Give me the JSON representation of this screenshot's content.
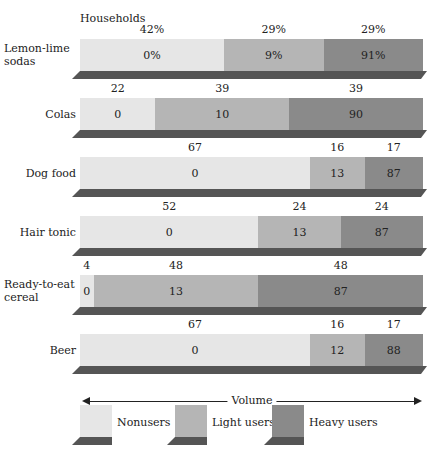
{
  "chart_data": {
    "type": "bar",
    "subtype": "stacked-horizontal-100-percent",
    "title": "",
    "header_label": "Households",
    "xlabel": "Volume",
    "legend": [
      "Nonusers",
      "Light users",
      "Heavy users"
    ],
    "legend_position": "bottom",
    "colors": {
      "Nonusers": "#e6e6e6",
      "Light users": "#b5b5b5",
      "Heavy users": "#8a8a8a"
    },
    "categories": [
      "Lemon-lime sodas",
      "Colas",
      "Dog food",
      "Hair tonic",
      "Ready-to-eat cereal",
      "Beer"
    ],
    "series": [
      {
        "name": "Nonusers",
        "households_pct": [
          42,
          22,
          67,
          52,
          4,
          67
        ],
        "volume_pct": [
          0,
          0,
          0,
          0,
          0,
          0
        ]
      },
      {
        "name": "Light users",
        "households_pct": [
          29,
          39,
          16,
          24,
          48,
          16
        ],
        "volume_pct": [
          9,
          10,
          13,
          13,
          13,
          12
        ]
      },
      {
        "name": "Heavy users",
        "households_pct": [
          29,
          39,
          17,
          24,
          48,
          17
        ],
        "volume_pct": [
          91,
          90,
          87,
          87,
          87,
          88
        ]
      }
    ],
    "rows": [
      {
        "label": "Lemon-lime sodas",
        "hh": [
          "42%",
          "29%",
          "29%"
        ],
        "vol": [
          "0%",
          "9%",
          "91%"
        ]
      },
      {
        "label": "Colas",
        "hh": [
          "22",
          "39",
          "39"
        ],
        "vol": [
          "0",
          "10",
          "90"
        ]
      },
      {
        "label": "Dog food",
        "hh": [
          "67",
          "16",
          "17"
        ],
        "vol": [
          "0",
          "13",
          "87"
        ]
      },
      {
        "label": "Hair tonic",
        "hh": [
          "52",
          "24",
          "24"
        ],
        "vol": [
          "0",
          "13",
          "87"
        ]
      },
      {
        "label": "Ready-to-eat cereal",
        "hh": [
          "4",
          "48",
          "48"
        ],
        "vol": [
          "0",
          "13",
          "87"
        ]
      },
      {
        "label": "Beer",
        "hh": [
          "67",
          "16",
          "17"
        ],
        "vol": [
          "0",
          "12",
          "88"
        ]
      }
    ]
  },
  "labels": {
    "households": "Households",
    "volume": "Volume",
    "rows": [
      {
        "l1": "Lemon-lime",
        "l2": "sodas"
      },
      {
        "l1": "Colas",
        "l2": ""
      },
      {
        "l1": "Dog food",
        "l2": ""
      },
      {
        "l1": "Hair tonic",
        "l2": ""
      },
      {
        "l1": "Ready-to-eat",
        "l2": "cereal"
      },
      {
        "l1": "Beer",
        "l2": ""
      }
    ],
    "legend": [
      "Nonusers",
      "Light users",
      "Heavy users"
    ]
  }
}
